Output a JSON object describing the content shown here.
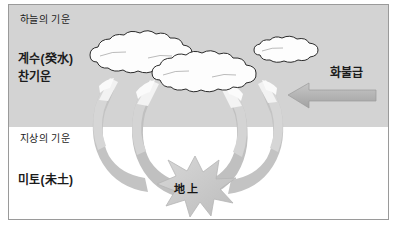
{
  "diagram": {
    "title_visible": false,
    "canvas": {
      "width": 397,
      "height": 227
    },
    "colors": {
      "sky_band": "#d3d3d3",
      "ground_band": "#ffffff",
      "frame_border": "#9a9a9a",
      "cloud_fill": "#fdfdfd",
      "cloud_outline": "#2e2e2e",
      "arrow_gray": "#b9b9b9",
      "arrow_light": "#efefef",
      "arrow_mid": "#cfcfcf",
      "starburst_fill": "#c9c9c9",
      "starburst_outline": "#b0b0b0",
      "text": "#1b1b1b"
    },
    "regions": {
      "sky_label": "하늘의 기운",
      "ground_label": "지상의 기운"
    },
    "labels": {
      "cold_water_stem": "계수(癸水)",
      "cold_energy": "찬기운",
      "earth_branch": "미토(未土)",
      "fire_label": "화불급",
      "ground_center": "地上"
    },
    "elements": {
      "clouds": [
        {
          "name": "cloud-large-left",
          "x": 88,
          "y": 40,
          "w": 108,
          "h": 38
        },
        {
          "name": "cloud-large-right",
          "x": 150,
          "y": 58,
          "w": 118,
          "h": 34
        },
        {
          "name": "cloud-small-top-right",
          "x": 252,
          "y": 40,
          "w": 74,
          "h": 24
        }
      ],
      "descending_arrows_count": 4,
      "horizontal_arrow": {
        "name": "fire-arrow",
        "direction": "left",
        "x_start": 375,
        "x_end": 288,
        "y": 95
      },
      "starburst": {
        "name": "ground-impact-starburst",
        "cx": 195,
        "cy": 186,
        "points": 11
      }
    }
  }
}
